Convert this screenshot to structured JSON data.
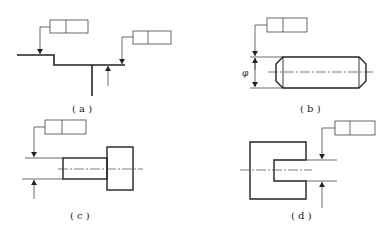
{
  "figure": {
    "panels": [
      {
        "id": "a",
        "label": "( a )",
        "description": "Stepped profile with two tolerance frames pointing to surfaces"
      },
      {
        "id": "b",
        "label": "( b )",
        "description": "Cylindrical pin with diameter dimension and tolerance frame on dimension line"
      },
      {
        "id": "c",
        "label": "( c )",
        "description": "Shaft with head; tolerance frame attached to shaft diameter dimension"
      },
      {
        "id": "d",
        "label": "( d )",
        "description": "C-shaped part with slot; tolerance frame attached to slot width dimension"
      }
    ],
    "diameter_symbol": "φ",
    "colors": {
      "line": "#222222",
      "thin": "#444444",
      "background": "#ffffff"
    }
  }
}
